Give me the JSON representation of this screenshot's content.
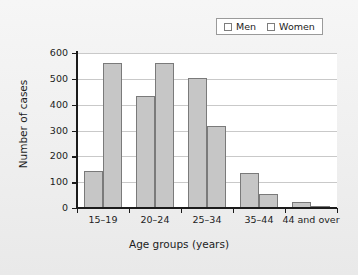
{
  "chart_data": {
    "type": "bar",
    "title": "",
    "xlabel": "Age groups (years)",
    "ylabel": "Number of cases",
    "categories": [
      "15–19",
      "20–24",
      "25–34",
      "35–44",
      "44 and over"
    ],
    "series": [
      {
        "name": "Men",
        "values": [
          145,
          433,
          505,
          134,
          24
        ],
        "color": "#c6c6c6"
      },
      {
        "name": "Women",
        "values": [
          562,
          562,
          317,
          53,
          8
        ],
        "color": "#c6c6c6"
      }
    ],
    "ylim": [
      0,
      600
    ],
    "yticks": [
      0,
      100,
      200,
      300,
      400,
      500,
      600
    ],
    "ytick_labels": [
      "0",
      "100",
      "200",
      "300",
      "400",
      "500",
      "600"
    ],
    "grid": "horizontal",
    "legend_position": "top-right"
  },
  "legend": {
    "entries": [
      {
        "label": "Men"
      },
      {
        "label": "Women"
      }
    ]
  },
  "axes": {
    "x_title": "Age groups (years)",
    "y_title": "Number of cases"
  },
  "colors": {
    "page_background": "#f1f1f1",
    "plot_background": "#ffffff",
    "bar_fill": "#c6c6c6",
    "bar_border": "#7a7a7a",
    "axis": "#1b1b1b",
    "gridline": "#c9c9c9"
  }
}
